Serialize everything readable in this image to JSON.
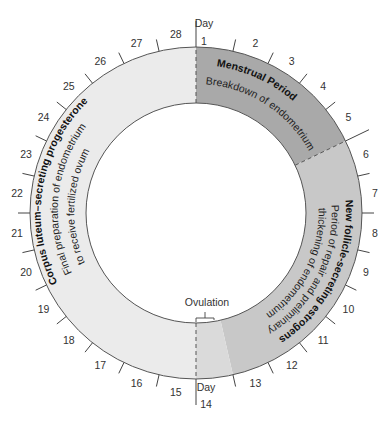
{
  "diagram": {
    "type": "menstrual-cycle-wheel",
    "total_days": 28,
    "day_prefix_label": "Day",
    "days": [
      "1",
      "2",
      "3",
      "4",
      "5",
      "6",
      "7",
      "8",
      "9",
      "10",
      "11",
      "12",
      "13",
      "14",
      "15",
      "16",
      "17",
      "18",
      "19",
      "20",
      "21",
      "22",
      "23",
      "24",
      "25",
      "26",
      "27",
      "28"
    ],
    "ovulation_label": "Ovulation",
    "colors": {
      "menstrual": "#a9a9a9",
      "estrogen": "#c8c8c8",
      "transition": "#dadada",
      "progesterone": "#ebebeb",
      "outline": "#555555"
    },
    "phases": [
      {
        "title": "Menstrual Period",
        "description": "Breakdown of endometrium",
        "start_day": 1,
        "end_day": 5
      },
      {
        "title": "New follicle-secreting estrogens",
        "description_line1": "Period of repair and preliminary",
        "description_line2": "thickening of endometrium",
        "start_day": 6,
        "end_day": 14
      },
      {
        "title": "Corpus luteum–secreting progesterone",
        "description_line1": "Final preparation of endometrium",
        "description_line2": "to receive fertilized ovum",
        "start_day": 15,
        "end_day": 28
      }
    ]
  }
}
